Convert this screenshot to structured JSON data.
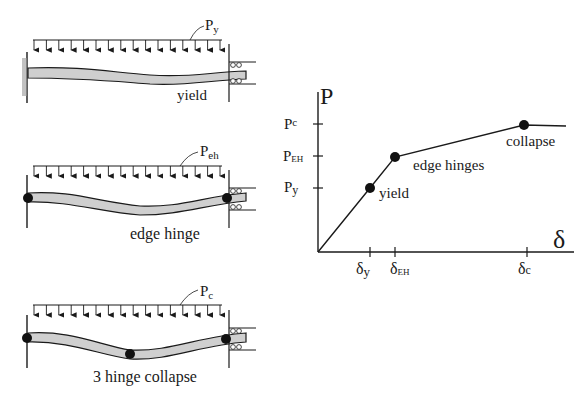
{
  "beams": [
    {
      "load_label": "P",
      "load_sub": "y",
      "caption": "yield",
      "hinges": 0
    },
    {
      "load_label": "P",
      "load_sub": "eh",
      "caption": "edge hinge",
      "hinges": 2
    },
    {
      "load_label": "P",
      "load_sub": "c",
      "caption": "3 hinge collapse",
      "hinges": 3
    }
  ],
  "chart_data": {
    "type": "line",
    "title": "",
    "ylabel": "P",
    "xlabel": "δ",
    "y_ticks": [
      {
        "label": "P",
        "sub": "c"
      },
      {
        "label": "P",
        "sub": "EH"
      },
      {
        "label": "P",
        "sub": "y"
      }
    ],
    "x_ticks": [
      {
        "label": "δ",
        "sub": "y"
      },
      {
        "label": "δ",
        "sub": "EH"
      },
      {
        "label": "δ",
        "sub": "c"
      }
    ],
    "points": [
      {
        "name": "origin",
        "x": 0,
        "y": 0
      },
      {
        "name": "yield",
        "x": "δy",
        "y": "Py"
      },
      {
        "name": "edge hinges",
        "x": "δEH",
        "y": "PEH"
      },
      {
        "name": "collapse",
        "x": "δc",
        "y": "Pc"
      }
    ],
    "annotations": [
      "yield",
      "edge hinges",
      "collapse"
    ],
    "grid": false
  },
  "colors": {
    "ink": "#1a1a1a",
    "beam_fill": "#cfcfcf",
    "hatch": "#8a8a8a"
  }
}
